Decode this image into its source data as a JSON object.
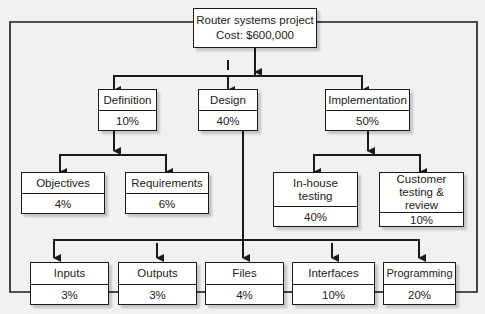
{
  "root": {
    "title": "Router systems project",
    "cost": "Cost: $600,000"
  },
  "level2": [
    {
      "id": "definition",
      "label": "Definition",
      "pct": "10%"
    },
    {
      "id": "design",
      "label": "Design",
      "pct": "40%"
    },
    {
      "id": "implementation",
      "label": "Implementation",
      "pct": "50%"
    }
  ],
  "definition_children": [
    {
      "id": "objectives",
      "label": "Objectives",
      "pct": "4%"
    },
    {
      "id": "requirements",
      "label": "Requirements",
      "pct": "6%"
    }
  ],
  "implementation_children": [
    {
      "id": "in-house-testing",
      "label": "In-house testing",
      "pct": "40%"
    },
    {
      "id": "customer-testing",
      "label": "Customer testing & review",
      "pct": "10%"
    }
  ],
  "design_children": [
    {
      "id": "inputs",
      "label": "Inputs",
      "pct": "3%"
    },
    {
      "id": "outputs",
      "label": "Outputs",
      "pct": "3%"
    },
    {
      "id": "files",
      "label": "Files",
      "pct": "4%"
    },
    {
      "id": "interfaces",
      "label": "Interfaces",
      "pct": "10%"
    },
    {
      "id": "programming",
      "label": "Programming",
      "pct": "20%"
    }
  ],
  "colors": {
    "line": "#1a1a1a",
    "box_fill": "#ffffff",
    "background": "#f1f1ef"
  }
}
